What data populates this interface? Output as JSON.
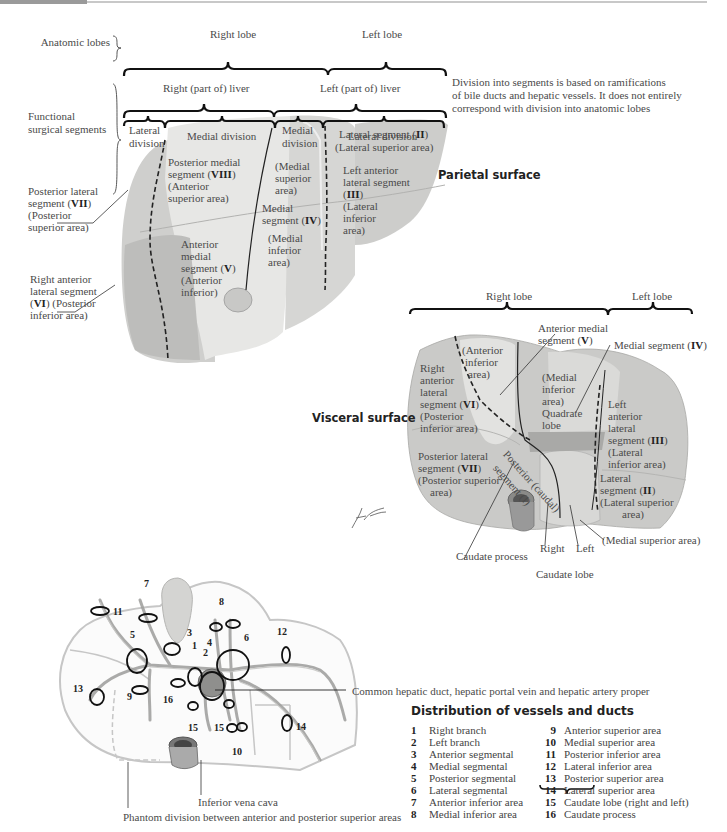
{
  "header_bar": {
    "accent_dark": "#9a9a9a",
    "accent_light": "#c8c8c8"
  },
  "parietal": {
    "row_labels": {
      "anatomic_lobes": "Anatomic lobes",
      "functional_line1": "Functional",
      "functional_line2": "surgical segments"
    },
    "anatomic": {
      "right": "Right lobe",
      "left": "Left lobe"
    },
    "functional": {
      "right": "Right (part of) liver",
      "left": "Left (part of) liver"
    },
    "divisions": {
      "right_lateral_1": "Lateral",
      "right_lateral_2": "division",
      "right_medial": "Medial division",
      "left_medial_1": "Medial",
      "left_medial_2": "division",
      "left_lateral": "Lateral division"
    },
    "note": {
      "line1": "Division into segments is based on ramifications",
      "line2": "of bile ducts and hepatic vessels. It does not entirely",
      "line3": "correspond with division into anatomic lobes"
    },
    "surface_title": "Parietal surface",
    "segments": {
      "viii_1": "Posterior medial",
      "viii_2a": "segment (",
      "viii_2b": "VIII",
      "viii_2c": ")",
      "viii_3": "(Anterior",
      "viii_4": "superior area)",
      "iv_sup_1": "(Medial",
      "iv_sup_2": "superior",
      "iv_sup_3": "area)",
      "iv_1": "Medial",
      "iv_2a": "segment (",
      "iv_2b": "IV",
      "iv_2c": ")",
      "iv_inf_1": "(Medial",
      "iv_inf_2": "inferior",
      "iv_inf_3": "area)",
      "ii_1a": "Lateral segment (",
      "ii_1b": "II",
      "ii_1c": ")",
      "ii_2": "(Lateral superior area)",
      "iii_1": "Left anterior",
      "iii_2": "lateral segment",
      "iii_3a": "(",
      "iii_3b": "III",
      "iii_3c": ")",
      "iii_4": "(Lateral",
      "iii_5": "inferior",
      "iii_6": "area)",
      "v_1": "Anterior",
      "v_2": "medial",
      "v_3a": "segment (",
      "v_3b": "V",
      "v_3c": ")",
      "v_4": "(Anterior",
      "v_5": "inferior)"
    },
    "callouts": {
      "vii_1": "Posterior lateral",
      "vii_2a": "segment (",
      "vii_2b": "VII",
      "vii_2c": ")",
      "vii_3": "(Posterior",
      "vii_4": "superior area)",
      "vi_1": "Right anterior",
      "vi_2": "lateral segment",
      "vi_3a": "(",
      "vi_3b": "VI",
      "vi_3c": ") (Posterior",
      "vi_4": "inferior area)"
    }
  },
  "visceral": {
    "surface_title": "Visceral surface",
    "lobes": {
      "right": "Right lobe",
      "left": "Left lobe"
    },
    "callouts": {
      "v_1": "Anterior medial",
      "v_2a": "segment (",
      "v_2b": "V",
      "v_2c": ")",
      "iv_a": "Medial segment (",
      "iv_b": "IV",
      "iv_c": ")",
      "caudate_process": "Caudate process",
      "right": "Right",
      "left": "Left",
      "caudate_lobe": "Caudate lobe",
      "medial_superior": "(Medial superior area)"
    },
    "segments": {
      "ant_inf_1": "(Anterior",
      "ant_inf_2": "inferior",
      "ant_inf_3": "area)",
      "vi_1": "Right",
      "vi_2": "anterior",
      "vi_3": "lateral",
      "vi_4a": "segment (",
      "vi_4b": "VI",
      "vi_4c": ")",
      "vi_5": "(Posterior",
      "vi_6": "inferior area)",
      "quad_1": "(Medial",
      "quad_2": "inferior",
      "quad_3": "area)",
      "quad_4": "Quadrate",
      "quad_5": "lobe",
      "iii_1": "Left",
      "iii_2": "anterior",
      "iii_3": "lateral",
      "iii_4a": "segment (",
      "iii_4b": "III",
      "iii_4c": ")",
      "iii_5": "(Lateral",
      "iii_6": "inferior area)",
      "vii_1": "Posterior lateral",
      "vii_2a": "segment (",
      "vii_2b": "VII",
      "vii_2c": ")",
      "vii_3": "(Posterior superior",
      "vii_4": "area)",
      "caudal_1": "Posterior (caudal)",
      "caudal_2": "segment (I)",
      "ii_1": "Lateral",
      "ii_2a": "segment (",
      "ii_2b": "II",
      "ii_2c": ")",
      "ii_3": "(Lateral superior",
      "ii_4": "area)"
    },
    "signature": "F. Netter"
  },
  "vessels": {
    "callout_common": "Common hepatic duct, hepatic portal vein and hepatic artery proper",
    "callout_ivc": "Inferior vena cava",
    "callout_phantom": "Phantom division between anterior and posterior superior areas",
    "markers": [
      "1",
      "2",
      "3",
      "4",
      "5",
      "6",
      "7",
      "8",
      "9",
      "10",
      "11",
      "12",
      "13",
      "14",
      "15",
      "15",
      "16"
    ]
  },
  "legend": {
    "title": "Distribution of vessels and ducts",
    "left": [
      {
        "num": "1",
        "label": "Right branch"
      },
      {
        "num": "2",
        "label": "Left branch"
      },
      {
        "num": "3",
        "label": "Anterior segmental"
      },
      {
        "num": "4",
        "label": "Medial segmental"
      },
      {
        "num": "5",
        "label": "Posterior segmental"
      },
      {
        "num": "6",
        "label": "Lateral segmental"
      },
      {
        "num": "7",
        "label": "Anterior inferior area"
      },
      {
        "num": "8",
        "label": "Medial inferior area"
      }
    ],
    "right": [
      {
        "num": "9",
        "label": "Anterior superior area"
      },
      {
        "num": "10",
        "label": "Medial superior area"
      },
      {
        "num": "11",
        "label": "Posterior inferior area"
      },
      {
        "num": "12",
        "label": "Lateral inferior area"
      },
      {
        "num": "13",
        "label": "Posterior superior area"
      },
      {
        "num": "14",
        "label": "Lateral superior area"
      },
      {
        "num": "15",
        "label": "Caudate lobe (right and left)"
      },
      {
        "num": "16",
        "label": "Caudate process"
      }
    ]
  },
  "colors": {
    "liver_light": "#e4e4e2",
    "liver_mid": "#d2d2d0",
    "liver_dark": "#b8b8b6",
    "line": "#2a2a2a",
    "outline_vessels": "#c4c4c4"
  }
}
